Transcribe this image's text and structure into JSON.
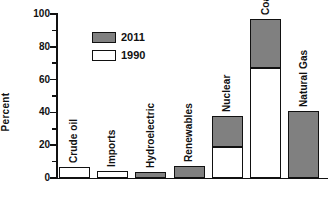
{
  "chart_data": {
    "type": "bar",
    "title": "",
    "subtitle": "",
    "xlabel": "",
    "ylabel": "Percent",
    "ylim": [
      0,
      100
    ],
    "ytick_labels": [
      "0",
      "20",
      "40",
      "60",
      "80",
      "100"
    ],
    "ytick_values": [
      0,
      20,
      40,
      60,
      80,
      100
    ],
    "yminor_values": [
      10,
      30,
      50,
      70,
      90
    ],
    "grid": false,
    "legend_position": "upper-left-inside",
    "stacked": true,
    "categories": [
      "Crude oil",
      "Imports",
      "Hydroelectric",
      "Renewables",
      "Nuclear",
      "Coal",
      "Natural Gas"
    ],
    "series": [
      {
        "name": "1990",
        "color": "#ffffff",
        "values": [
          7,
          4,
          0,
          0,
          19,
          67,
          0
        ]
      },
      {
        "name": "2011",
        "color": "#808080",
        "values": [
          0,
          0,
          3.5,
          7.5,
          38,
          97,
          41
        ]
      }
    ],
    "bars": [
      {
        "category": "Crude oil",
        "segments": [
          {
            "series": "1990",
            "from": 0,
            "to": 7,
            "fill": "1990"
          }
        ]
      },
      {
        "category": "Imports",
        "segments": [
          {
            "series": "1990",
            "from": 0,
            "to": 4,
            "fill": "1990"
          }
        ]
      },
      {
        "category": "Hydroelectric",
        "segments": [
          {
            "series": "2011",
            "from": 0,
            "to": 3.5,
            "fill": "2011"
          }
        ]
      },
      {
        "category": "Renewables",
        "segments": [
          {
            "series": "2011",
            "from": 0,
            "to": 7.5,
            "fill": "2011"
          }
        ]
      },
      {
        "category": "Nuclear",
        "segments": [
          {
            "series": "1990",
            "from": 0,
            "to": 19,
            "fill": "1990"
          },
          {
            "series": "2011",
            "from": 19,
            "to": 38,
            "fill": "2011"
          }
        ]
      },
      {
        "category": "Coal",
        "segments": [
          {
            "series": "1990",
            "from": 0,
            "to": 67,
            "fill": "1990"
          },
          {
            "series": "2011",
            "from": 67,
            "to": 97,
            "fill": "2011"
          }
        ]
      },
      {
        "category": "Natural Gas",
        "segments": [
          {
            "series": "2011",
            "from": 0,
            "to": 41,
            "fill": "2011"
          }
        ]
      }
    ]
  },
  "legend": {
    "items": [
      {
        "label": "2011",
        "fill": "2011"
      },
      {
        "label": "1990",
        "fill": "1990"
      }
    ]
  },
  "colors": {
    "series_2011": "#808080",
    "series_1990": "#ffffff",
    "axis": "#111111",
    "background": "#ffffff"
  }
}
